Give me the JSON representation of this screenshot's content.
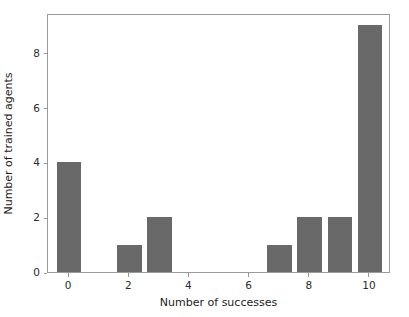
{
  "chart_data": {
    "type": "bar",
    "title": "",
    "xlabel": "Number of successes",
    "ylabel": "Number of trained agents",
    "categories": [
      0,
      1,
      2,
      3,
      4,
      5,
      6,
      7,
      8,
      9,
      10
    ],
    "values": [
      4,
      0,
      1,
      2,
      0,
      0,
      0,
      1,
      2,
      2,
      9
    ],
    "series": [
      {
        "name": "Number of trained agents",
        "values": [
          4,
          0,
          1,
          2,
          0,
          0,
          0,
          1,
          2,
          2,
          9
        ]
      }
    ],
    "xlim": [
      -0.7,
      10.7
    ],
    "ylim": [
      0,
      9.45
    ],
    "xticks": [
      0,
      2,
      4,
      6,
      8,
      10
    ],
    "xtick_labels": [
      "0",
      "2",
      "4",
      "6",
      "8",
      "10"
    ],
    "yticks": [
      0,
      2,
      4,
      6,
      8
    ],
    "ytick_labels": [
      "0",
      "2",
      "4",
      "6",
      "8"
    ],
    "grid": false,
    "legend": null,
    "bar_color": "#696969",
    "bar_width": 0.82,
    "background_color": "#ffffff",
    "axis_color": "#9a9a9a",
    "tick_label_color": "#2b2b2b",
    "axis_label_color": "#1c1c1c"
  }
}
